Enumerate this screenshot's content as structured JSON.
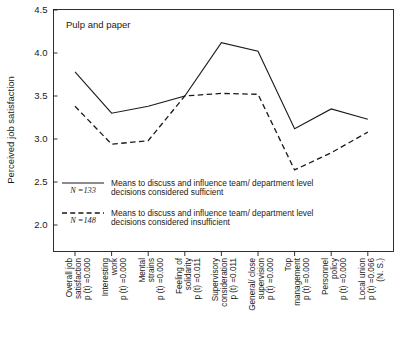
{
  "chart_data": {
    "type": "line",
    "title": "Pulp and paper",
    "xlabel": "",
    "ylabel": "Perceived job satisfaction",
    "ylim": [
      2.0,
      4.5
    ],
    "yticks": [
      "2.0",
      "2.5",
      "3.0",
      "3.5",
      "4.0",
      "4.5"
    ],
    "grid": false,
    "legend_position": "inside-lower-left",
    "categories": [
      "Overall job satisfaction",
      "Interesting work",
      "Mental strains",
      "Feeling of solidarity",
      "Supervisory consideration",
      "General/close supervision",
      "Top management",
      "Personnel policy",
      "Local union"
    ],
    "category_lines": [
      [
        "Overall job",
        "satisfaction"
      ],
      [
        "Interesting",
        "work"
      ],
      [
        "Mental",
        "strains"
      ],
      [
        "Feeling of",
        "solidarity"
      ],
      [
        "Supervisory",
        "consideration"
      ],
      [
        "General/ close",
        "supervision"
      ],
      [
        "Top",
        "management"
      ],
      [
        "Personnel",
        "policy"
      ],
      [
        "Local union"
      ]
    ],
    "category_pvalues": [
      "p (t) =0.000",
      "p (t) =0.000",
      "p (t) =0.000",
      "p (t) =0.011",
      "p (t) =0.011",
      "p (t) =0.000",
      "p (t) =0.000",
      "p (t) =0.000",
      "p (t) =0.066"
    ],
    "category_notes": [
      "",
      "",
      "",
      "",
      "",
      "",
      "",
      "",
      "(N. S.)"
    ],
    "series": [
      {
        "name": "Means to discuss and influence team/ department level decisions considered sufficient",
        "n_label": "N =133",
        "style": "solid",
        "values": [
          3.78,
          3.3,
          3.38,
          3.5,
          4.12,
          4.02,
          3.12,
          3.35,
          3.23
        ]
      },
      {
        "name": "Means to discuss and influence team/ department level decisions considered insufficient",
        "n_label": "N =148",
        "style": "dashed",
        "values": [
          3.38,
          2.94,
          2.98,
          3.5,
          3.53,
          3.52,
          2.64,
          2.84,
          3.08
        ]
      }
    ]
  },
  "legend": {
    "entries": [
      {
        "n_label": "N =133",
        "line1": "Means to discuss and influence team/ department level",
        "line2": "decisions considered sufficient",
        "style": "solid"
      },
      {
        "n_label": "N =148",
        "line1": "Means to discuss and influence team/ department level",
        "line2": "decisions considered insufficient",
        "style": "dashed"
      }
    ]
  },
  "colors": {
    "ink": "#1a1a1a",
    "background": "#ffffff"
  }
}
